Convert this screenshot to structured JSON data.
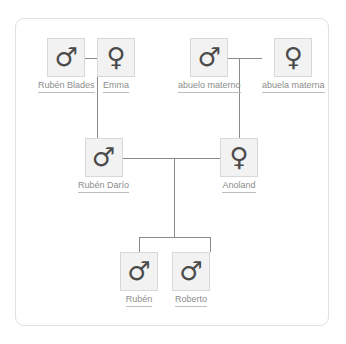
{
  "diagram": {
    "colors": {
      "card_border": "#e2e2e2",
      "box_fill": "#f2f2f2",
      "box_border": "#d8d8d8",
      "glyph": "#4a4a4a",
      "label": "#8d8d8d",
      "connector": "#8a8a8a",
      "background": "#ffffff"
    },
    "icons": {
      "male": "male-gender-icon",
      "female": "female-gender-icon"
    },
    "glyphs": {
      "male": "♂",
      "female": "♀"
    },
    "generations": [
      {
        "name": "grandparents",
        "people": [
          {
            "id": "ruben-blades",
            "label": "Rubén Blades",
            "sex": "male",
            "glyph": "♂",
            "x": 38,
            "y": 38
          },
          {
            "id": "emma",
            "label": "Emma",
            "sex": "female",
            "glyph": "♀",
            "x": 97,
            "y": 38
          },
          {
            "id": "abuelo-materno",
            "label": "abuelo materno",
            "sex": "male",
            "glyph": "♂",
            "x": 178,
            "y": 38
          },
          {
            "id": "abuela-materna",
            "label": "abuela materna",
            "sex": "female",
            "glyph": "♀",
            "x": 262,
            "y": 38
          }
        ]
      },
      {
        "name": "parents",
        "people": [
          {
            "id": "ruben-dario",
            "label": "Rubén Darío",
            "sex": "male",
            "glyph": "♂",
            "x": 78,
            "y": 138
          },
          {
            "id": "anoland",
            "label": "Anoland",
            "sex": "female",
            "glyph": "♀",
            "x": 220,
            "y": 138
          }
        ]
      },
      {
        "name": "children",
        "people": [
          {
            "id": "ruben",
            "label": "Rubén",
            "sex": "male",
            "glyph": "♂",
            "x": 120,
            "y": 252
          },
          {
            "id": "roberto",
            "label": "Roberto",
            "sex": "male",
            "glyph": "♂",
            "x": 172,
            "y": 252
          }
        ]
      }
    ],
    "unions": [
      {
        "id": "union-blades-emma",
        "partners": [
          "ruben-blades",
          "emma"
        ],
        "child_drop_x": 97
      },
      {
        "id": "union-abuelos",
        "partners": [
          "abuelo-materno",
          "abuela-materna"
        ],
        "child_drop_x": 239
      },
      {
        "id": "union-dario-anoland",
        "partners": [
          "ruben-dario",
          "anoland"
        ],
        "child_drop_x": 174
      }
    ],
    "parent_child_links": [
      {
        "from": "union-blades-emma",
        "to": "ruben-dario"
      },
      {
        "from": "union-abuelos",
        "to": "anoland"
      },
      {
        "from": "union-dario-anoland",
        "to": "ruben"
      },
      {
        "from": "union-dario-anoland",
        "to": "roberto"
      }
    ]
  }
}
